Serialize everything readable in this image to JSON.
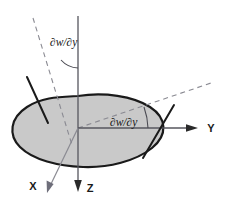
{
  "figure": {
    "background_color": "#ffffff",
    "surface": {
      "name": "plate-midsurface",
      "fill_color": "#c9c9c9",
      "stroke_color": "#1a1a1a",
      "stroke_width": 2.2
    },
    "axes": [
      {
        "id": "y",
        "label": "Y",
        "direction": "right",
        "arrow": true,
        "color": "#1a1a1a"
      },
      {
        "id": "z",
        "label": "Z",
        "direction": "down",
        "arrow": true,
        "color": "#1a1a1a"
      },
      {
        "id": "x",
        "label": "X",
        "direction": "down-left",
        "arrow": true,
        "color": "#6e6e7a"
      }
    ],
    "angle_labels": [
      {
        "id": "upper-rotation",
        "text": "∂w/∂y",
        "position": "upper-left"
      },
      {
        "id": "lower-rotation",
        "text": "∂w/∂y",
        "position": "center-right"
      }
    ],
    "dashed_lines": [
      {
        "id": "normal-reference-dashed",
        "color": "#8a8a92",
        "dash": "5,4"
      },
      {
        "id": "tangent-reference-dashed",
        "color": "#8a8a92",
        "dash": "5,4"
      }
    ],
    "tangent_lines": [
      {
        "id": "left-normal-segment",
        "color": "#1a1a1a"
      },
      {
        "id": "right-normal-segment",
        "color": "#1a1a1a"
      }
    ],
    "angle_arcs": [
      {
        "id": "upper-angle-arc",
        "color": "#4a4a52"
      },
      {
        "id": "lower-angle-arc",
        "color": "#4a4a52"
      }
    ]
  }
}
